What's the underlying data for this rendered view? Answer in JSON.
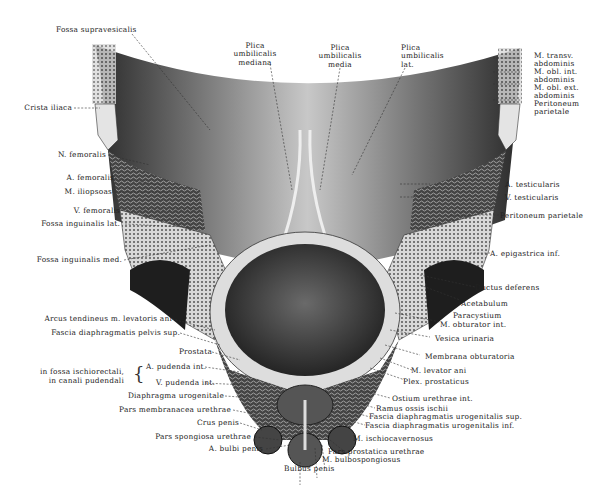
{
  "figure": {
    "labels_top": {
      "fossa_supravesicalis": "Fossa supravesicalis",
      "plica_mediana": [
        "Plica",
        "umbilicalis",
        "mediana"
      ],
      "plica_media": [
        "Plica",
        "umbilicalis",
        "media"
      ],
      "plica_lat": [
        "Plica",
        "umbilicalis",
        "lat."
      ]
    },
    "labels_right_top": {
      "m_transv": [
        "M. transv.",
        "abdominis"
      ],
      "m_obl_int": [
        "M. obl. int.",
        "abdominis"
      ],
      "m_obl_ext": [
        "M. obl. ext.",
        "abdominis"
      ],
      "peritoneum": [
        "Peritoneum",
        "parietale"
      ]
    },
    "labels_left": {
      "crista_iliaca": "Crista iliaca",
      "n_femoralis": "N. femoralis",
      "a_femoralis": "A. femoralis",
      "m_iliopsoas": "M. iliopsoas",
      "v_femoralis": "V. femoralis",
      "fossa_ing_lat": "Fossa inguinalis lat.",
      "fossa_ing_med": "Fossa inguinalis med.",
      "arcus_tendineus": "Arcus tendineus m. levatoris ani",
      "fascia_pelvis_sup": "Fascia diaphragmatis pelvis sup.",
      "prostata": "Prostata",
      "group_caption": [
        "in fossa ischiorectali,",
        "in canali pudendali"
      ],
      "a_pudenda": "A. pudenda int.",
      "v_pudenda": "V. pudenda int.",
      "diaphragma_urogenitale": "Diaphragma urogenitale",
      "pars_membranacea": "Pars membranacea urethrae",
      "crus_penis": "Crus penis",
      "pars_spongiosa": "Pars spongiosa urethrae",
      "a_bulbi": "A. bulbi penis",
      "bulbus_penis": "Bulbus penis"
    },
    "labels_right": {
      "a_testicularis": "A. testicularis",
      "v_testicularis": "V. testicularis",
      "peritoneum_parietale": "Peritoneum parietale",
      "a_epigastrica": "A. epigastrica inf.",
      "ductus_deferens": "Ductus deferens",
      "acetabulum": "Acetabulum",
      "paracystium": "Paracystium",
      "m_obturator": "M. obturator int.",
      "vesica": "Vesica urinaria",
      "membrana_obt": "Membrana obturatoria",
      "m_levator": "M. levator ani",
      "plex_prost": "Plex. prostaticus",
      "ostium": "Ostium urethrae int.",
      "ramus_ischii": "Ramus ossis ischii",
      "fascia_uro_sup": "Fascia diaphragmatis urogenitalis sup.",
      "fascia_uro_inf": "Fascia diaphragmatis urogenitalis inf.",
      "m_ischiocav": "M. ischiocavernosus",
      "pars_prostatica": "Pars prostatica urethrae",
      "m_bulbospong": "M. bulbospongiosus"
    }
  }
}
